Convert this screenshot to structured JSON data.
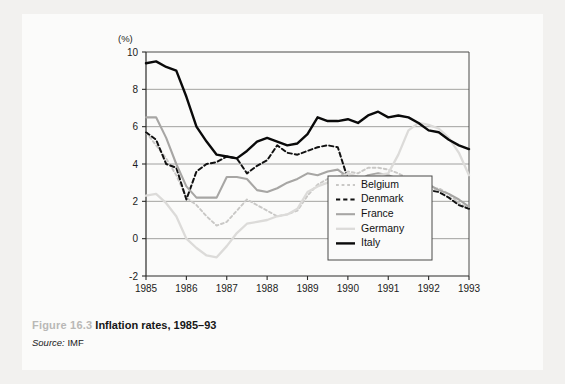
{
  "figure": {
    "number_label": "Figure 16.3",
    "title": "Inflation rates, 1985–93",
    "source_label": "Source:",
    "source_value": "IMF"
  },
  "chart_data": {
    "type": "line",
    "title": "Inflation rates, 1985–93",
    "xlabel": "",
    "ylabel": "(%)",
    "yunit_label": "(%)",
    "xlim": [
      1985,
      1993
    ],
    "ylim": [
      -2,
      10
    ],
    "y_ticks": [
      10,
      8,
      6,
      4,
      2,
      0,
      -2
    ],
    "x_ticks": [
      1985,
      1986,
      1987,
      1988,
      1989,
      1990,
      1991,
      1992,
      1993
    ],
    "grid": "horizontal",
    "legend_position": "bottom-right",
    "legend_entries": [
      "Belgium",
      "Denmark",
      "France",
      "Germany",
      "Italy"
    ],
    "series": [
      {
        "name": "Belgium",
        "color": "#c9c8c6",
        "style": "dotted",
        "width": 1.9,
        "x": [
          1985.0,
          1985.25,
          1985.5,
          1985.75,
          1986.0,
          1986.25,
          1986.5,
          1986.75,
          1987.0,
          1987.25,
          1987.5,
          1987.75,
          1988.0,
          1988.25,
          1988.5,
          1988.75,
          1989.0,
          1989.25,
          1989.5,
          1989.75,
          1990.0,
          1990.25,
          1990.5,
          1990.75,
          1991.0,
          1991.25,
          1991.5,
          1991.75,
          1992.0,
          1992.25,
          1992.5,
          1992.75,
          1993.0
        ],
        "y": [
          5.7,
          5.0,
          4.3,
          3.4,
          2.2,
          1.8,
          1.2,
          0.7,
          0.9,
          1.5,
          2.1,
          1.8,
          1.5,
          1.2,
          1.3,
          1.5,
          2.3,
          2.9,
          3.2,
          3.3,
          3.6,
          3.5,
          3.8,
          3.8,
          3.7,
          3.5,
          3.2,
          2.9,
          2.6,
          2.7,
          2.4,
          1.9,
          1.6
        ]
      },
      {
        "name": "Denmark",
        "color": "#111111",
        "style": "dashed",
        "width": 2.0,
        "x": [
          1985.0,
          1985.25,
          1985.5,
          1985.75,
          1986.0,
          1986.25,
          1986.5,
          1986.75,
          1987.0,
          1987.25,
          1987.5,
          1987.75,
          1988.0,
          1988.25,
          1988.5,
          1988.75,
          1989.0,
          1989.25,
          1989.5,
          1989.75,
          1990.0,
          1990.25,
          1990.5,
          1990.75,
          1991.0,
          1991.25,
          1991.5,
          1991.75,
          1992.0,
          1992.25,
          1992.5,
          1992.75,
          1993.0
        ],
        "y": [
          5.7,
          5.3,
          4.0,
          3.8,
          2.1,
          3.6,
          4.0,
          4.1,
          4.4,
          4.3,
          3.5,
          3.9,
          4.2,
          5.0,
          4.6,
          4.5,
          4.7,
          4.9,
          5.0,
          4.9,
          3.2,
          2.6,
          2.4,
          2.4,
          2.6,
          2.3,
          2.3,
          2.4,
          2.6,
          2.5,
          2.2,
          1.8,
          1.6
        ]
      },
      {
        "name": "France",
        "color": "#a7a6a4",
        "style": "solid",
        "width": 2.1,
        "x": [
          1985.0,
          1985.25,
          1985.5,
          1985.75,
          1986.0,
          1986.25,
          1986.5,
          1986.75,
          1987.0,
          1987.25,
          1987.5,
          1987.75,
          1988.0,
          1988.25,
          1988.5,
          1988.75,
          1989.0,
          1989.25,
          1989.5,
          1989.75,
          1990.0,
          1990.25,
          1990.5,
          1990.75,
          1991.0,
          1991.25,
          1991.5,
          1991.75,
          1992.0,
          1992.25,
          1992.5,
          1992.75,
          1993.0
        ],
        "y": [
          6.5,
          6.5,
          5.4,
          4.0,
          2.8,
          2.2,
          2.2,
          2.2,
          3.3,
          3.3,
          3.2,
          2.6,
          2.5,
          2.7,
          3.0,
          3.2,
          3.5,
          3.4,
          3.6,
          3.7,
          3.3,
          3.1,
          3.4,
          3.5,
          3.4,
          3.2,
          3.2,
          3.1,
          2.9,
          2.6,
          2.4,
          2.1,
          1.7
        ]
      },
      {
        "name": "Germany",
        "color": "#dcdbd9",
        "style": "solid",
        "width": 2.3,
        "x": [
          1985.0,
          1985.25,
          1985.5,
          1985.75,
          1986.0,
          1986.25,
          1986.5,
          1986.75,
          1987.0,
          1987.25,
          1987.5,
          1987.75,
          1988.0,
          1988.25,
          1988.5,
          1988.75,
          1989.0,
          1989.25,
          1989.5,
          1989.75,
          1990.0,
          1990.25,
          1990.5,
          1990.75,
          1991.0,
          1991.25,
          1991.5,
          1991.75,
          1992.0,
          1992.25,
          1992.5,
          1992.75,
          1993.0
        ],
        "y": [
          2.3,
          2.4,
          1.9,
          1.2,
          0.0,
          -0.5,
          -0.9,
          -1.0,
          -0.4,
          0.3,
          0.8,
          0.9,
          1.0,
          1.2,
          1.3,
          1.6,
          2.5,
          2.8,
          3.0,
          3.2,
          3.5,
          3.3,
          3.3,
          3.4,
          3.5,
          4.5,
          5.8,
          6.2,
          6.1,
          5.9,
          5.4,
          4.6,
          3.4
        ]
      },
      {
        "name": "Italy",
        "color": "#0a0a0a",
        "style": "solid",
        "width": 2.4,
        "x": [
          1985.0,
          1985.25,
          1985.5,
          1985.75,
          1986.0,
          1986.25,
          1986.5,
          1986.75,
          1987.0,
          1987.25,
          1987.5,
          1987.75,
          1988.0,
          1988.25,
          1988.5,
          1988.75,
          1989.0,
          1989.25,
          1989.5,
          1989.75,
          1990.0,
          1990.25,
          1990.5,
          1990.75,
          1991.0,
          1991.25,
          1991.5,
          1991.75,
          1992.0,
          1992.25,
          1992.5,
          1992.75,
          1993.0
        ],
        "y": [
          9.4,
          9.5,
          9.2,
          9.0,
          7.6,
          6.0,
          5.2,
          4.5,
          4.4,
          4.3,
          4.7,
          5.2,
          5.4,
          5.2,
          5.0,
          5.1,
          5.6,
          6.5,
          6.3,
          6.3,
          6.4,
          6.2,
          6.6,
          6.8,
          6.5,
          6.6,
          6.5,
          6.2,
          5.8,
          5.7,
          5.3,
          5.0,
          4.8
        ]
      }
    ]
  }
}
